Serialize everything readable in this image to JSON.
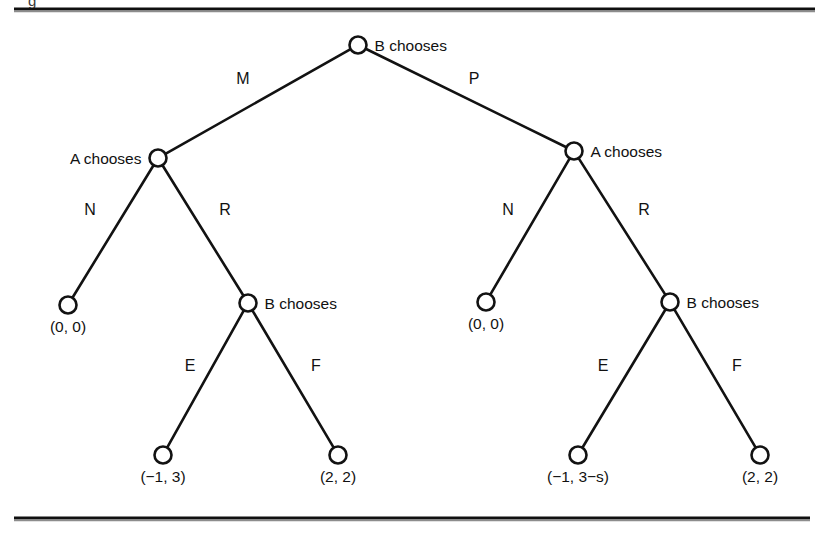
{
  "figure": {
    "kind": "extensive-form-game-tree",
    "background_color": "#ffffff",
    "ink_color": "#121212",
    "caption_fragment": "g",
    "rules": {
      "top_label": "top-horizontal-rule",
      "bottom_label": "bottom-horizontal-rule"
    }
  },
  "chart_data": {
    "type": "diagram",
    "title": "",
    "nodes": [
      {
        "id": "root",
        "label": "B chooses",
        "x": 358,
        "y": 45,
        "label_side": "right",
        "kind": "decision"
      },
      {
        "id": "a_left",
        "label": "A chooses",
        "x": 158,
        "y": 158,
        "label_side": "left",
        "kind": "decision"
      },
      {
        "id": "a_right",
        "label": "A chooses",
        "x": 574,
        "y": 151,
        "label_side": "right",
        "kind": "decision"
      },
      {
        "id": "leaf_left_n",
        "label": "(0, 0)",
        "x": 68,
        "y": 305,
        "label_side": "below",
        "kind": "terminal"
      },
      {
        "id": "b_left",
        "label": "B chooses",
        "x": 248,
        "y": 303,
        "label_side": "right",
        "kind": "decision"
      },
      {
        "id": "leaf_right_n",
        "label": "(0, 0)",
        "x": 486,
        "y": 302,
        "label_side": "below",
        "kind": "terminal"
      },
      {
        "id": "b_right",
        "label": "B chooses",
        "x": 670,
        "y": 302,
        "label_side": "right",
        "kind": "decision"
      },
      {
        "id": "leaf_left_e",
        "label": "(−1, 3)",
        "x": 163,
        "y": 455,
        "label_side": "below",
        "kind": "terminal"
      },
      {
        "id": "leaf_left_f",
        "label": "(2, 2)",
        "x": 338,
        "y": 455,
        "label_side": "below",
        "kind": "terminal"
      },
      {
        "id": "leaf_right_e",
        "label": "(−1, 3−s)",
        "x": 578,
        "y": 455,
        "label_side": "below",
        "kind": "terminal"
      },
      {
        "id": "leaf_right_f",
        "label": "(2, 2)",
        "x": 760,
        "y": 455,
        "label_side": "below",
        "kind": "terminal"
      }
    ],
    "edges": [
      {
        "id": "e_root_m",
        "from": "root",
        "to": "a_left",
        "label": "M",
        "label_x": 243,
        "label_y": 84
      },
      {
        "id": "e_root_p",
        "from": "root",
        "to": "a_right",
        "label": "P",
        "label_x": 474,
        "label_y": 84
      },
      {
        "id": "e_aleft_n",
        "from": "a_left",
        "to": "leaf_left_n",
        "label": "N",
        "label_x": 90,
        "label_y": 215
      },
      {
        "id": "e_aleft_r",
        "from": "a_left",
        "to": "b_left",
        "label": "R",
        "label_x": 225,
        "label_y": 215
      },
      {
        "id": "e_aright_n",
        "from": "a_right",
        "to": "leaf_right_n",
        "label": "N",
        "label_x": 508,
        "label_y": 215
      },
      {
        "id": "e_aright_r",
        "from": "a_right",
        "to": "b_right",
        "label": "R",
        "label_x": 644,
        "label_y": 215
      },
      {
        "id": "e_bleft_e",
        "from": "b_left",
        "to": "leaf_left_e",
        "label": "E",
        "label_x": 190,
        "label_y": 371
      },
      {
        "id": "e_bleft_f",
        "from": "b_left",
        "to": "leaf_left_f",
        "label": "F",
        "label_x": 316,
        "label_y": 371
      },
      {
        "id": "e_bright_e",
        "from": "b_right",
        "to": "leaf_right_e",
        "label": "E",
        "label_x": 603,
        "label_y": 371
      },
      {
        "id": "e_bright_f",
        "from": "b_right",
        "to": "leaf_right_f",
        "label": "F",
        "label_x": 737,
        "label_y": 371
      }
    ],
    "node_radius": 8.5,
    "players": [
      "A",
      "B"
    ],
    "actions": [
      "M",
      "P",
      "N",
      "R",
      "E",
      "F"
    ],
    "payoffs": [
      "(0, 0)",
      "(−1, 3)",
      "(2, 2)",
      "(−1, 3−s)"
    ],
    "xlabel": "",
    "ylabel": "",
    "grid": false,
    "legend": "none"
  }
}
